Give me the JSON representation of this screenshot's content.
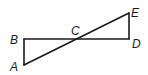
{
  "diagram": {
    "type": "geometry",
    "points": {
      "A": {
        "label": "A",
        "x": 24,
        "y": 65
      },
      "B": {
        "label": "B",
        "x": 24,
        "y": 39
      },
      "C": {
        "label": "C",
        "x": 76,
        "y": 39
      },
      "D": {
        "label": "D",
        "x": 129,
        "y": 39
      },
      "E": {
        "label": "E",
        "x": 129,
        "y": 13
      }
    },
    "segments": [
      [
        "A",
        "B"
      ],
      [
        "B",
        "D"
      ],
      [
        "D",
        "E"
      ],
      [
        "A",
        "E"
      ]
    ],
    "labels": {
      "A": "A",
      "B": "B",
      "C": "C",
      "D": "D",
      "E": "E"
    },
    "colors": {
      "stroke": "#1a1a1a",
      "background": "#ffffff"
    }
  }
}
